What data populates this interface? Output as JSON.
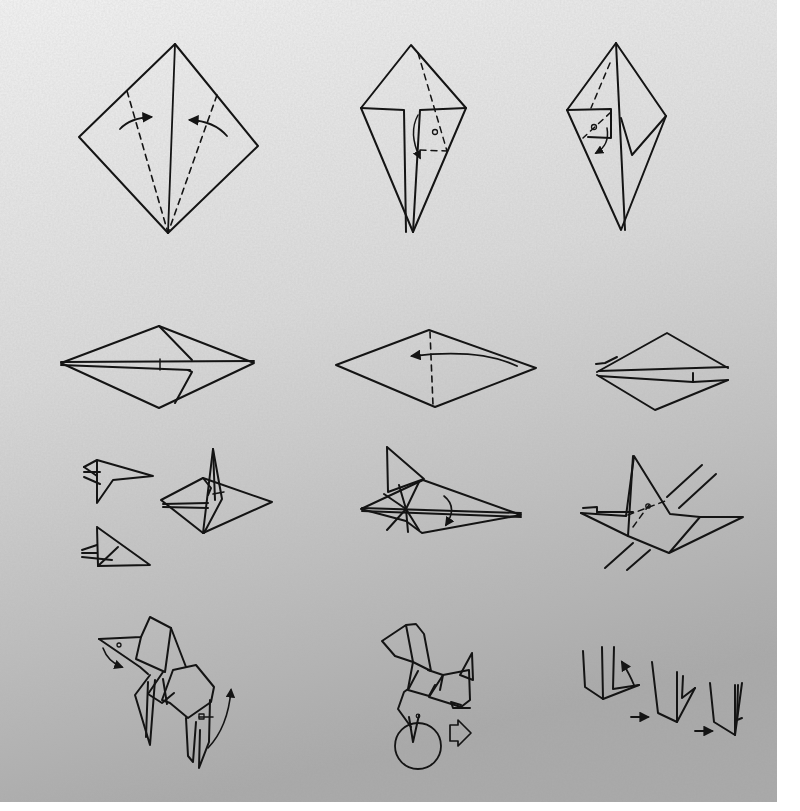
{
  "colors": {
    "paper_top": "#eeeeee",
    "paper_mid": "#d6d6d6",
    "paper_bottom": "#a9a9a9",
    "ink": "#141414",
    "margin": "#ffffff"
  },
  "steps": [
    {
      "id": 1,
      "row": 1,
      "label": "kite-fold-both-sides-to-center",
      "center": [
        168,
        147
      ]
    },
    {
      "id": 2,
      "row": 1,
      "label": "squash-fold-right-flap",
      "center": [
        413,
        130
      ]
    },
    {
      "id": 3,
      "row": 1,
      "label": "squash-fold-left-flap",
      "center": [
        617,
        130
      ]
    },
    {
      "id": 4,
      "row": 2,
      "label": "rotate-horizontal",
      "center": [
        157,
        365
      ]
    },
    {
      "id": 5,
      "row": 2,
      "label": "valley-fold-in-half",
      "center": [
        436,
        365
      ]
    },
    {
      "id": 6,
      "row": 2,
      "label": "folded-result",
      "center": [
        666,
        365
      ]
    },
    {
      "id": 7,
      "row": 3,
      "label": "head-detail-views",
      "center": [
        115,
        510
      ]
    },
    {
      "id": 8,
      "row": 3,
      "label": "inside-reverse-fold-neck",
      "center": [
        215,
        492
      ]
    },
    {
      "id": 9,
      "row": 3,
      "label": "fold-flap-down",
      "center": [
        441,
        485
      ]
    },
    {
      "id": 10,
      "row": 3,
      "label": "fold-legs-along-lines",
      "center": [
        660,
        510
      ]
    },
    {
      "id": 11,
      "row": 4,
      "label": "shape-head-and-tail",
      "center": [
        170,
        690
      ]
    },
    {
      "id": 12,
      "row": 4,
      "label": "finished-dog-with-leg-detail",
      "center": [
        428,
        695
      ]
    },
    {
      "id": 13,
      "row": 4,
      "label": "leg-detail-sequence",
      "center": [
        665,
        695
      ]
    }
  ]
}
